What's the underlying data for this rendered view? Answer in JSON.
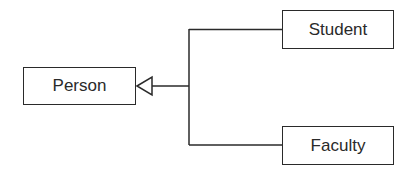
{
  "diagram": {
    "type": "uml-class-inheritance",
    "classes": [
      {
        "id": "person",
        "label": "Person",
        "role": "superclass"
      },
      {
        "id": "student",
        "label": "Student",
        "role": "subclass"
      },
      {
        "id": "faculty",
        "label": "Faculty",
        "role": "subclass"
      }
    ],
    "relationships": [
      {
        "from": "student",
        "to": "person",
        "kind": "generalization"
      },
      {
        "from": "faculty",
        "to": "person",
        "kind": "generalization"
      }
    ],
    "colors": {
      "stroke": "#2a2a2a",
      "background": "#ffffff"
    }
  }
}
